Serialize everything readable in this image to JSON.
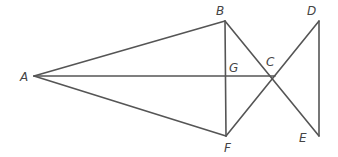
{
  "diagram": {
    "type": "geometry-figure",
    "stroke_color": "#555555",
    "label_color": "#444444",
    "points": {
      "A": {
        "x": 34,
        "y": 76
      },
      "B": {
        "x": 225,
        "y": 21
      },
      "C": {
        "x": 275,
        "y": 76
      },
      "D": {
        "x": 319,
        "y": 21
      },
      "E": {
        "x": 319,
        "y": 136
      },
      "F": {
        "x": 226,
        "y": 136
      },
      "G": {
        "x": 225,
        "y": 76
      }
    },
    "labels": {
      "A": {
        "text": "A",
        "x": 20,
        "y": 81
      },
      "B": {
        "text": "B",
        "x": 216,
        "y": 15
      },
      "C": {
        "text": "C",
        "x": 266,
        "y": 66
      },
      "D": {
        "text": "D",
        "x": 307,
        "y": 15
      },
      "E": {
        "text": "E",
        "x": 299,
        "y": 142
      },
      "F": {
        "text": "F",
        "x": 224,
        "y": 152
      },
      "G": {
        "text": "G",
        "x": 229,
        "y": 72
      }
    },
    "segments": [
      [
        "A",
        "B"
      ],
      [
        "A",
        "F"
      ],
      [
        "A",
        "C"
      ],
      [
        "B",
        "F"
      ],
      [
        "B",
        "E"
      ],
      [
        "F",
        "D"
      ],
      [
        "D",
        "E"
      ]
    ]
  }
}
